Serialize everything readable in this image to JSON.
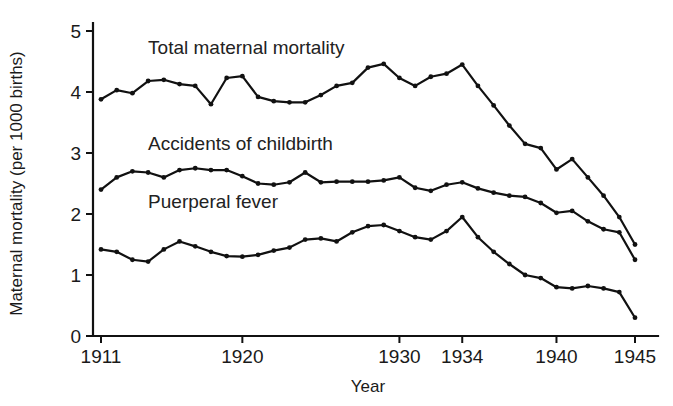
{
  "chart_data": {
    "type": "line",
    "title": "",
    "xlabel": "Year",
    "ylabel": "Maternal mortality (per 1000 births)",
    "xlim": [
      1911,
      1945
    ],
    "ylim": [
      0,
      5
    ],
    "grid": false,
    "legend": "inline-annotations",
    "x_tick_labels": [
      "1911",
      "1920",
      "1930",
      "1934",
      "1940",
      "1945"
    ],
    "x_tick_values": [
      1911,
      1920,
      1930,
      1934,
      1940,
      1945
    ],
    "y_tick_labels": [
      "0",
      "1",
      "2",
      "3",
      "4",
      "5"
    ],
    "y_tick_values": [
      0,
      1,
      2,
      3,
      4,
      5
    ],
    "x": [
      1911,
      1912,
      1913,
      1914,
      1915,
      1916,
      1917,
      1918,
      1919,
      1920,
      1921,
      1922,
      1923,
      1924,
      1925,
      1926,
      1927,
      1928,
      1929,
      1930,
      1931,
      1932,
      1933,
      1934,
      1935,
      1936,
      1937,
      1938,
      1939,
      1940,
      1941,
      1942,
      1943,
      1944,
      1945
    ],
    "series": [
      {
        "name": "Total maternal mortality",
        "label": "Total maternal mortality",
        "label_x": 1914.0,
        "label_y": 4.62,
        "values": [
          3.88,
          4.03,
          3.98,
          4.18,
          4.2,
          4.13,
          4.1,
          3.8,
          4.23,
          4.26,
          3.92,
          3.85,
          3.83,
          3.83,
          3.95,
          4.1,
          4.15,
          4.4,
          4.46,
          4.23,
          4.1,
          4.25,
          4.3,
          4.45,
          4.1,
          3.78,
          3.45,
          3.15,
          3.08,
          2.73,
          2.9,
          2.6,
          2.3,
          1.95,
          1.5
        ]
      },
      {
        "name": "Accidents of childbirth",
        "label": "Accidents of childbirth",
        "label_x": 1914.0,
        "label_y": 3.05,
        "values": [
          2.4,
          2.6,
          2.7,
          2.68,
          2.6,
          2.72,
          2.75,
          2.72,
          2.72,
          2.62,
          2.5,
          2.48,
          2.52,
          2.68,
          2.52,
          2.53,
          2.53,
          2.53,
          2.55,
          2.6,
          2.43,
          2.38,
          2.48,
          2.52,
          2.42,
          2.35,
          2.3,
          2.28,
          2.18,
          2.02,
          2.05,
          1.88,
          1.75,
          1.7,
          1.25
        ]
      },
      {
        "name": "Puerperal fever",
        "label": "Puerperal fever",
        "label_x": 1914.0,
        "label_y": 2.1,
        "values": [
          1.42,
          1.38,
          1.25,
          1.22,
          1.42,
          1.55,
          1.47,
          1.38,
          1.31,
          1.3,
          1.33,
          1.4,
          1.45,
          1.58,
          1.6,
          1.55,
          1.7,
          1.8,
          1.82,
          1.72,
          1.62,
          1.58,
          1.72,
          1.95,
          1.62,
          1.38,
          1.18,
          1.0,
          0.95,
          0.8,
          0.78,
          0.82,
          0.78,
          0.72,
          0.3
        ]
      }
    ]
  }
}
